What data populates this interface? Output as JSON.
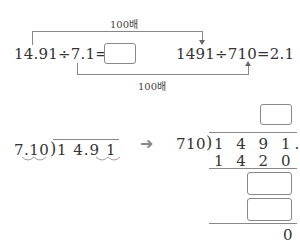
{
  "top": {
    "label_top": "100배",
    "label_bottom": "100배",
    "left_equation": "14.91÷7.1=",
    "right_equation": "1491÷710=2.1"
  },
  "bottom": {
    "left_division": {
      "divisor": "7.10",
      "dividend": "1 4.9 1"
    },
    "arrow": "➜",
    "right_division": {
      "divisor": "710",
      "dividend": "1 4 9 1.0",
      "subtract1": "1 4 2 0",
      "remainder": "0"
    }
  }
}
